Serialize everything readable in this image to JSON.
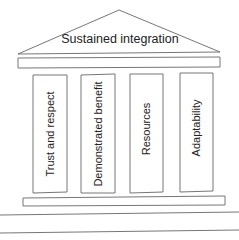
{
  "roof": {
    "label": "Sustained integration"
  },
  "pillars": [
    {
      "label": "Trust and respect",
      "cx": 50,
      "cy": 134
    },
    {
      "label": "Demonstrated benefit",
      "cx": 98,
      "cy": 134
    },
    {
      "label": "Resources",
      "cx": 146,
      "cy": 134
    },
    {
      "label": "Adaptability",
      "cx": 196,
      "cy": 134
    }
  ],
  "colors": {
    "stroke": "#666666",
    "text": "#222222",
    "background": "#ffffff"
  }
}
